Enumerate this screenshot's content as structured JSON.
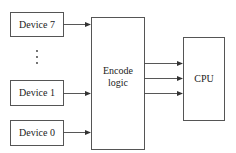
{
  "diagram": {
    "devices": [
      {
        "id": "device7",
        "label": "Device 7"
      },
      {
        "id": "device1",
        "label": "Device 1"
      },
      {
        "id": "device0",
        "label": "Device 0"
      }
    ],
    "ellipsis": "⋮",
    "encoder": {
      "line1": "Encode",
      "line2": "logic"
    },
    "cpu": {
      "label": "CPU"
    },
    "encoder_to_cpu_lines": 3
  }
}
